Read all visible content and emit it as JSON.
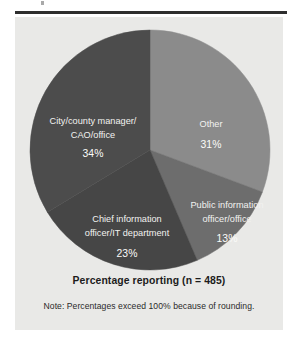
{
  "figure": {
    "caption": "Percentage reporting (n = 485)",
    "note": "Note: Percentages exceed 100% because of rounding.",
    "panel_bg": "#e9e9e7",
    "rule_color": "#2e2e2e"
  },
  "chart_data": {
    "type": "pie",
    "title": "Percentage reporting (n = 485)",
    "xlabel": "",
    "ylabel": "",
    "n": 485,
    "units": "percent",
    "start_angle_deg": 0,
    "direction": "clockwise",
    "legend": "none (labels drawn inside slices)",
    "grid": false,
    "annotations": [
      "Note: Percentages exceed 100% because of rounding."
    ],
    "categories": [
      "Other",
      "Public information officer/office",
      "Chief information officer/IT department",
      "City/county manager/CAO/office"
    ],
    "values": [
      31,
      13,
      23,
      34
    ],
    "slices": [
      {
        "label_line1": "Other",
        "label_line2": "",
        "value": 31,
        "value_text": "31%",
        "color": "#8b8b8b",
        "label_x": 196,
        "label_y": 108,
        "value_x": 196,
        "value_y": 128
      },
      {
        "label_line1": "Public information",
        "label_line2": "officer/office",
        "value": 13,
        "value_text": "13%",
        "color": "#6d6d6d",
        "label_x": 212,
        "label_y": 189,
        "value_x": 212,
        "value_y": 222
      },
      {
        "label_line1": "Chief information",
        "label_line2": "officer/IT department",
        "value": 23,
        "value_text": "23%",
        "color": "#464646",
        "label_x": 112,
        "label_y": 203,
        "value_x": 112,
        "value_y": 237
      },
      {
        "label_line1": "City/county manager/",
        "label_line2": "CAO/office",
        "value": 34,
        "value_text": "34%",
        "color": "#4c4c4c",
        "label_x": 78,
        "label_y": 105,
        "value_x": 78,
        "value_y": 137
      }
    ]
  }
}
